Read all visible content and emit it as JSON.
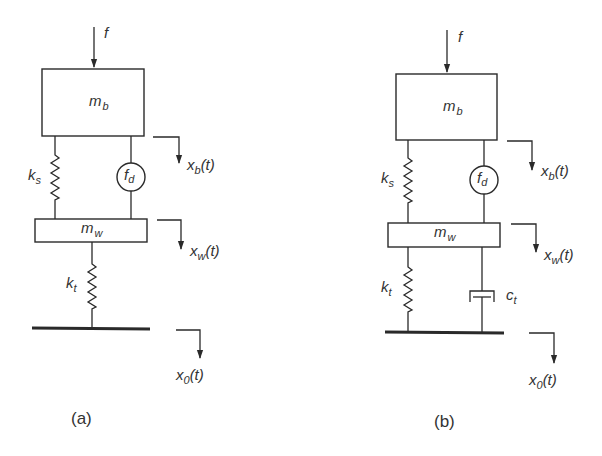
{
  "figure": {
    "panels": [
      {
        "id": "a",
        "caption": "(a)",
        "input_force": {
          "symbol": "f"
        },
        "body_mass": {
          "symbol": "m",
          "sub": "b"
        },
        "wheel_mass": {
          "symbol": "m",
          "sub": "w"
        },
        "suspension_spring": {
          "symbol": "k",
          "sub": "s"
        },
        "actuator_force": {
          "symbol": "f",
          "sub": "d"
        },
        "tire_spring": {
          "symbol": "k",
          "sub": "t"
        },
        "body_displacement": {
          "symbol": "x",
          "sub": "b",
          "arg": "(t)"
        },
        "wheel_displacement": {
          "symbol": "x",
          "sub": "w",
          "arg": "(t)"
        },
        "road_displacement": {
          "symbol": "x",
          "sub": "0",
          "arg": "(t)"
        }
      },
      {
        "id": "b",
        "caption": "(b)",
        "input_force": {
          "symbol": "f"
        },
        "body_mass": {
          "symbol": "m",
          "sub": "b"
        },
        "wheel_mass": {
          "symbol": "m",
          "sub": "w"
        },
        "suspension_spring": {
          "symbol": "k",
          "sub": "s"
        },
        "actuator_force": {
          "symbol": "f",
          "sub": "d"
        },
        "tire_spring": {
          "symbol": "k",
          "sub": "t"
        },
        "tire_damper": {
          "symbol": "c",
          "sub": "t"
        },
        "body_displacement": {
          "symbol": "x",
          "sub": "b",
          "arg": "(t)"
        },
        "wheel_displacement": {
          "symbol": "x",
          "sub": "w",
          "arg": "(t)"
        },
        "road_displacement": {
          "symbol": "x",
          "sub": "0",
          "arg": "(t)"
        }
      }
    ],
    "colors": {
      "line": "#2a2a2a",
      "text": "#333333",
      "background": "#ffffff"
    }
  }
}
